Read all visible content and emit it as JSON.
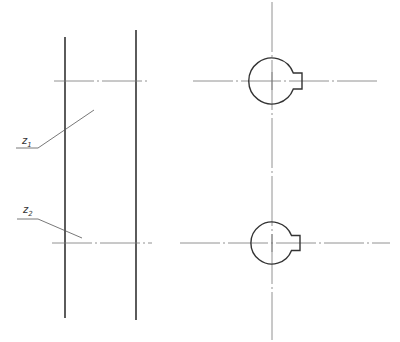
{
  "diagram": {
    "type": "technical-drawing",
    "colors": {
      "outline": "#333333",
      "centerline": "#777777",
      "leader": "#555555",
      "background": "#ffffff"
    },
    "labels": [
      {
        "id": "z1",
        "base": "z",
        "subscript": "1"
      },
      {
        "id": "z2",
        "base": "z",
        "subscript": "2"
      }
    ],
    "shaft_lines": [
      {
        "x": 65,
        "y1": 37,
        "y2": 318
      },
      {
        "x": 136,
        "y1": 30,
        "y2": 320
      }
    ],
    "gears": [
      {
        "name": "gear-z1",
        "cx": 272,
        "cy": 81,
        "r": 23,
        "keyway": {
          "x": 297,
          "y1": 73,
          "y2": 88,
          "w": 6
        }
      },
      {
        "name": "gear-z2",
        "cx": 272,
        "cy": 243,
        "r": 21,
        "keyway": {
          "x": 295,
          "y1": 235,
          "y2": 250,
          "w": 6
        }
      }
    ]
  }
}
